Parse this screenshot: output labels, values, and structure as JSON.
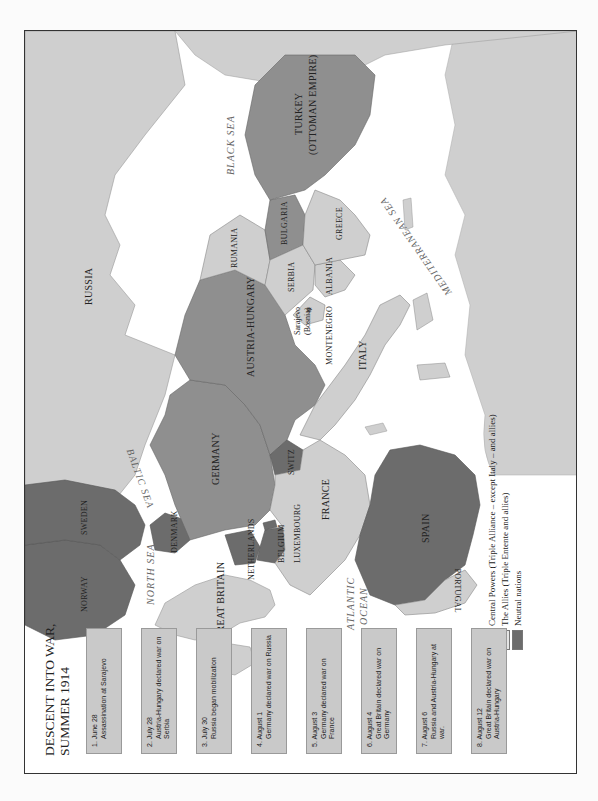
{
  "title": {
    "line1": "DESCENT INTO WAR,",
    "line2": "SUMMER 1914"
  },
  "timeline": [
    {
      "date": "1. June 28",
      "desc": "Assassination at Sarajevo"
    },
    {
      "date": "2. July 28",
      "desc": "Austria-Hungary declared war on Serbia"
    },
    {
      "date": "3. July 30",
      "desc": "Russia began mobilization"
    },
    {
      "date": "4. August 1",
      "desc": "Germany declared war on Russia"
    },
    {
      "date": "5. August 3",
      "desc": "Germany declared war on France"
    },
    {
      "date": "6. August 4",
      "desc": "Great Britain declared war on Germany"
    },
    {
      "date": "7. August 6",
      "desc": "Russia and Austria-Hungary at war."
    },
    {
      "date": "8. August 12",
      "desc": "Great Britain declared war on Austria-Hungary"
    }
  ],
  "legend": [
    {
      "label": "Central Powers (Triple Alliance – except Italy – and allies)",
      "color": "#8f8f8f"
    },
    {
      "label": "The Allies (Triple Entente and allies)",
      "color": "#d0d0d0"
    },
    {
      "label": "Neutral nations",
      "color": "#6e6e6e"
    }
  ],
  "colors": {
    "central": "#8f8f8f",
    "allies": "#cfcfcf",
    "neutral": "#6c6c6c",
    "sea": "#ffffff",
    "event_box": "#c9c9c9"
  },
  "countries": {
    "russia": "RUSSIA",
    "germany": "GERMANY",
    "austria_hungary": "AUSTRIA-HUNGARY",
    "turkey_1": "TURKEY",
    "turkey_2": "(OTTOMAN EMPIRE)",
    "rumania": "RUMANIA",
    "bulgaria": "BULGARIA",
    "serbia": "SERBIA",
    "greece": "GREECE",
    "albania": "ALBANIA",
    "montenegro": "MONTENEGRO",
    "sarajevo_1": "Sarajevo",
    "sarajevo_2": "(Bosnia)",
    "italy": "ITALY",
    "switz": "SWITZ",
    "france": "FRANCE",
    "luxembourg": "LUXEMBOURG",
    "belgium": "BELGIUM",
    "netherlands": "NETHERLANDS",
    "denmark": "DENMARK",
    "norway": "NORWAY",
    "sweden": "SWEDEN",
    "great_britain": "GREAT BRITAIN",
    "spain": "SPAIN",
    "portugal": "PORTUGAL"
  },
  "seas": {
    "baltic": "BALTIC SEA",
    "north": "NORTH SEA",
    "black": "BLACK SEA",
    "mediterranean": "MEDITERRANEAN SEA",
    "atlantic_1": "ATLANTIC",
    "atlantic_2": "OCEAN"
  },
  "markers": {
    "sarajevo_star": "✵"
  }
}
